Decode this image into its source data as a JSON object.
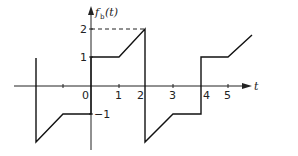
{
  "diagram": {
    "type": "piecewise-periodic-waveform",
    "function_label": "f",
    "function_subscript": "b",
    "function_arg": "(t)",
    "x_axis_label": "t",
    "x_ticks": [
      {
        "value": -1,
        "label": ""
      },
      {
        "value": 0,
        "label": "0"
      },
      {
        "value": 1,
        "label": "1"
      },
      {
        "value": 2,
        "label": "2"
      },
      {
        "value": 3,
        "label": "3"
      },
      {
        "value": 4,
        "label": "4"
      },
      {
        "value": 5,
        "label": "5"
      }
    ],
    "y_ticks": [
      {
        "value": 2,
        "label": "2"
      },
      {
        "value": 1,
        "label": "1"
      },
      {
        "value": -1,
        "label": "−1"
      }
    ],
    "period": 4,
    "segments": [
      {
        "t": [
          -2,
          -2
        ],
        "f": [
          1,
          -2
        ],
        "kind": "jump"
      },
      {
        "t": [
          -2,
          -1
        ],
        "f": [
          -2,
          -1
        ],
        "kind": "ramp"
      },
      {
        "t": [
          -1,
          0
        ],
        "f": [
          -1,
          -1
        ],
        "kind": "flat"
      },
      {
        "t": [
          0,
          0
        ],
        "f": [
          -1,
          1
        ],
        "kind": "jump"
      },
      {
        "t": [
          0,
          1
        ],
        "f": [
          1,
          1
        ],
        "kind": "flat"
      },
      {
        "t": [
          1,
          2
        ],
        "f": [
          1,
          2
        ],
        "kind": "ramp"
      },
      {
        "t": [
          2,
          2
        ],
        "f": [
          2,
          -2
        ],
        "kind": "jump"
      },
      {
        "t": [
          2,
          3
        ],
        "f": [
          -2,
          -1
        ],
        "kind": "ramp"
      },
      {
        "t": [
          3,
          4
        ],
        "f": [
          -1,
          -1
        ],
        "kind": "flat"
      },
      {
        "t": [
          4,
          4
        ],
        "f": [
          -1,
          1
        ],
        "kind": "jump"
      },
      {
        "t": [
          4,
          5
        ],
        "f": [
          1,
          1
        ],
        "kind": "flat"
      },
      {
        "t": [
          5,
          5.8
        ],
        "f": [
          1,
          1.8
        ],
        "kind": "ramp"
      }
    ],
    "dashed_guide": {
      "from_t": 0,
      "to_t": 2,
      "at_f": 2
    }
  }
}
